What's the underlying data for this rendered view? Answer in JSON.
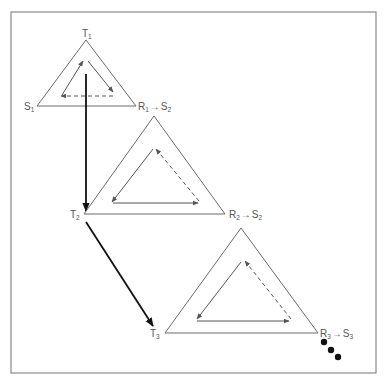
{
  "diagram": {
    "colors": {
      "frame": "#8a8a8a",
      "triangle_outline": "#6b6b6b",
      "inner_arrows": "#555555",
      "transition_arrows": "#111111",
      "labels": "#555555"
    },
    "triangles": [
      {
        "id": 1,
        "apex_label": "T",
        "apex_sub": "1",
        "left_label": "S",
        "left_sub": "1",
        "right_label_a": "R",
        "right_sub_a": "1",
        "arrow": "→",
        "right_label_b": "S",
        "right_sub_b": "2",
        "inner_cycle": "clockwise: left side up, right side down, dashed base leftward"
      },
      {
        "id": 2,
        "apex_label": "",
        "left_label": "T",
        "left_sub": "2",
        "right_label_a": "R",
        "right_sub_a": "2",
        "arrow": "→",
        "right_label_b": "S",
        "right_sub_b": "2",
        "inner_cycle": "counter-clockwise: left side down, base rightward, dashed right side up"
      },
      {
        "id": 3,
        "apex_label": "",
        "left_label": "T",
        "left_sub": "3",
        "right_label_a": "R",
        "right_sub_a": "3",
        "arrow": "→",
        "right_label_b": "S",
        "right_sub_b": "3",
        "inner_cycle": "counter-clockwise: left side down, base rightward, dashed right side up"
      }
    ],
    "transitions": [
      {
        "from": "T1",
        "to": "T2",
        "style": "bold vertical arrow"
      },
      {
        "from": "T2",
        "to": "T3",
        "style": "bold diagonal arrow"
      }
    ],
    "continuation": "three dots (ellipsis) after R3 → S3"
  }
}
